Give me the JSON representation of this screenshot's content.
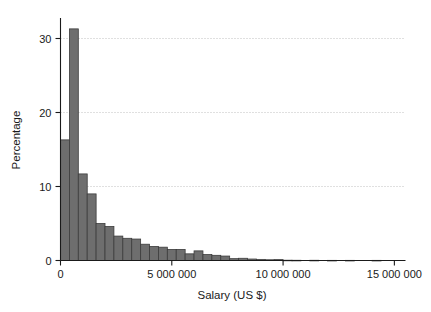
{
  "chart_data": {
    "type": "bar",
    "title": "",
    "subtitle": "",
    "xlabel": "Salary (US $)",
    "ylabel": "Percentage",
    "xlim": [
      0,
      15500000
    ],
    "ylim": [
      0,
      32.5
    ],
    "grid": "horizontal-dotted",
    "legend": "none",
    "bin_width": 400000,
    "bar_color": "#6e6e6e",
    "bar_edge_color": "#3c3c3c",
    "x_ticks": [
      {
        "value": 0,
        "label": "0"
      },
      {
        "value": 5000000,
        "label": "5 000 000"
      },
      {
        "value": 10000000,
        "label": "10 000 000"
      },
      {
        "value": 15000000,
        "label": "15 000 000"
      }
    ],
    "y_ticks": [
      {
        "value": 0,
        "label": "0"
      },
      {
        "value": 10,
        "label": "10"
      },
      {
        "value": 20,
        "label": "20"
      },
      {
        "value": 30,
        "label": "30"
      }
    ],
    "bins": [
      {
        "x0": 0,
        "x1": 400000,
        "value": 16.3
      },
      {
        "x0": 400000,
        "x1": 800000,
        "value": 31.3
      },
      {
        "x0": 800000,
        "x1": 1200000,
        "value": 11.7
      },
      {
        "x0": 1200000,
        "x1": 1600000,
        "value": 9.0
      },
      {
        "x0": 1600000,
        "x1": 2000000,
        "value": 5.0
      },
      {
        "x0": 2000000,
        "x1": 2400000,
        "value": 4.6
      },
      {
        "x0": 2400000,
        "x1": 2800000,
        "value": 3.3
      },
      {
        "x0": 2800000,
        "x1": 3200000,
        "value": 3.0
      },
      {
        "x0": 3200000,
        "x1": 3600000,
        "value": 2.9
      },
      {
        "x0": 3600000,
        "x1": 4000000,
        "value": 2.2
      },
      {
        "x0": 4000000,
        "x1": 4400000,
        "value": 1.9
      },
      {
        "x0": 4400000,
        "x1": 4800000,
        "value": 1.8
      },
      {
        "x0": 4800000,
        "x1": 5200000,
        "value": 1.5
      },
      {
        "x0": 5200000,
        "x1": 5600000,
        "value": 1.5
      },
      {
        "x0": 5600000,
        "x1": 6000000,
        "value": 0.9
      },
      {
        "x0": 6000000,
        "x1": 6400000,
        "value": 1.3
      },
      {
        "x0": 6400000,
        "x1": 6800000,
        "value": 0.8
      },
      {
        "x0": 6800000,
        "x1": 7200000,
        "value": 0.7
      },
      {
        "x0": 7200000,
        "x1": 7600000,
        "value": 0.6
      },
      {
        "x0": 7600000,
        "x1": 8000000,
        "value": 0.25
      },
      {
        "x0": 8000000,
        "x1": 8400000,
        "value": 0.3
      },
      {
        "x0": 8400000,
        "x1": 8800000,
        "value": 0.2
      },
      {
        "x0": 8800000,
        "x1": 9200000,
        "value": 0.15
      },
      {
        "x0": 9200000,
        "x1": 9600000,
        "value": 0.1
      },
      {
        "x0": 9600000,
        "x1": 10000000,
        "value": 0.12
      },
      {
        "x0": 10000000,
        "x1": 10400000,
        "value": 0.04
      },
      {
        "x0": 10400000,
        "x1": 10800000,
        "value": 0.03
      },
      {
        "x0": 11200000,
        "x1": 11600000,
        "value": 0.03
      },
      {
        "x0": 12000000,
        "x1": 12400000,
        "value": 0.02
      },
      {
        "x0": 12800000,
        "x1": 13200000,
        "value": 0.02
      },
      {
        "x0": 14000000,
        "x1": 14400000,
        "value": 0.02
      }
    ]
  }
}
